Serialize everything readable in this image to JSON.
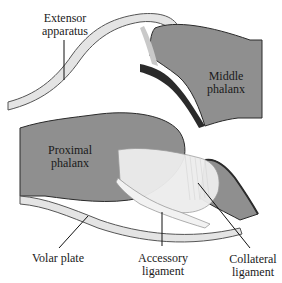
{
  "diagram": {
    "type": "anatomical-illustration",
    "colors": {
      "bone": "#8f8f8f",
      "bone_outline": "#2a2a2a",
      "cartilage_edge": "#2b2b2b",
      "tendon": "#e4e4e4",
      "ligament": "#ededed",
      "background": "#ffffff",
      "text": "#1a1a1a"
    },
    "labels": {
      "extensor": {
        "line1": "Extensor",
        "line2": "apparatus"
      },
      "middle_phalanx": {
        "line1": "Middle",
        "line2": "phalanx"
      },
      "proximal_phalanx": {
        "line1": "Proximal",
        "line2": "phalanx"
      },
      "volar_plate": {
        "line1": "Volar plate"
      },
      "accessory": {
        "line1": "Accessory",
        "line2": "ligament"
      },
      "collateral": {
        "line1": "Collateral",
        "line2": "ligament"
      }
    }
  }
}
